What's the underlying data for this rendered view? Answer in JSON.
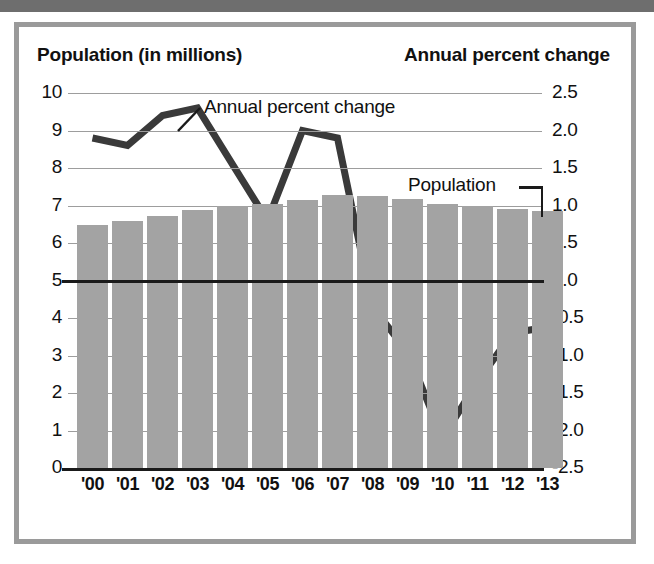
{
  "header": {
    "left_title": "Population (in millions)",
    "right_title": "Annual percent change"
  },
  "colors": {
    "bar": "#a3a3a3",
    "line": "#3a3a3a",
    "grid": "#9d9d9d",
    "axis": "#1a1a1a",
    "frame": "#9a9a9a",
    "band": "#6e6e6e"
  },
  "annotations": {
    "line_label": "Annual percent change",
    "bar_label": "Population"
  },
  "chart_data": {
    "type": "bar",
    "xlabel": "",
    "ylabel": "Population (in millions)",
    "y2label": "Annual percent change",
    "grid": true,
    "legend": "annotations",
    "categories": [
      "'00",
      "'01",
      "'02",
      "'03",
      "'04",
      "'05",
      "'06",
      "'07",
      "'08",
      "'09",
      "'10",
      "'11",
      "'12",
      "'13"
    ],
    "ylim": [
      0,
      10
    ],
    "yticks": [
      "0",
      "1",
      "2",
      "3",
      "4",
      "5",
      "6",
      "7",
      "8",
      "9",
      "10"
    ],
    "y2lim": [
      -2.5,
      2.5
    ],
    "y2ticks": [
      "-2.5",
      "-2.0",
      "-1.5",
      "-1.0",
      "-0.5",
      "0.0",
      "0.5",
      "1.0",
      "1.5",
      "2.0",
      "2.5"
    ],
    "series": [
      {
        "name": "Population",
        "type": "bar",
        "axis": "left",
        "unit": "millions",
        "values": [
          6.48,
          6.58,
          6.72,
          6.88,
          7.0,
          7.05,
          7.15,
          7.28,
          7.25,
          7.18,
          7.05,
          6.98,
          6.92,
          6.85
        ]
      },
      {
        "name": "Annual percent change",
        "type": "line",
        "axis": "right",
        "unit": "percent",
        "values": [
          1.9,
          1.8,
          2.2,
          2.3,
          1.55,
          0.8,
          2.0,
          1.9,
          -0.35,
          -0.95,
          -2.1,
          -1.35,
          -0.7,
          -0.62
        ]
      }
    ]
  }
}
